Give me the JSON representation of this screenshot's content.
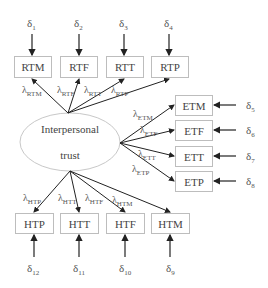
{
  "latent": {
    "line1": "Interpersonal",
    "line2": "trust"
  },
  "top_indicators": [
    {
      "label": "RTM",
      "error": "δ",
      "error_sub": "1",
      "loading": "λ",
      "loading_sub": "RTM"
    },
    {
      "label": "RTF",
      "error": "δ",
      "error_sub": "2",
      "loading": "λ",
      "loading_sub": "RTF"
    },
    {
      "label": "RTT",
      "error": "δ",
      "error_sub": "3",
      "loading": "λ",
      "loading_sub": "RTT"
    },
    {
      "label": "RTP",
      "error": "δ",
      "error_sub": "4",
      "loading": "λ",
      "loading_sub": "RTP"
    }
  ],
  "right_indicators": [
    {
      "label": "ETM",
      "error": "δ",
      "error_sub": "5",
      "loading": "λ",
      "loading_sub": "ETM"
    },
    {
      "label": "ETF",
      "error": "δ",
      "error_sub": "6",
      "loading": "λ",
      "loading_sub": "ETF"
    },
    {
      "label": "ETT",
      "error": "δ",
      "error_sub": "7",
      "loading": "λ",
      "loading_sub": "ETT"
    },
    {
      "label": "ETP",
      "error": "δ",
      "error_sub": "8",
      "loading": "λ",
      "loading_sub": "ETP"
    }
  ],
  "bottom_indicators": [
    {
      "label": "HTP",
      "error": "δ",
      "error_sub": "12",
      "loading": "λ",
      "loading_sub": "HTP"
    },
    {
      "label": "HTT",
      "error": "δ",
      "error_sub": "11",
      "loading": "λ",
      "loading_sub": "HTT"
    },
    {
      "label": "HTF",
      "error": "δ",
      "error_sub": "10",
      "loading": "λ",
      "loading_sub": "HTF"
    },
    {
      "label": "HTM",
      "error": "δ",
      "error_sub": "9",
      "loading": "λ",
      "loading_sub": "HTM"
    }
  ]
}
